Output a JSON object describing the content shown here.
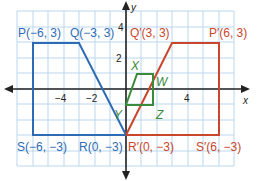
{
  "diagram": {
    "type": "coordinate-plane-transformation",
    "axes": {
      "x_label": "x",
      "y_label": "y",
      "x_ticks": [
        "−4",
        "−2",
        "4"
      ],
      "y_ticks": [
        "4",
        "2"
      ]
    },
    "colors": {
      "original": "#2e6bb5",
      "image": "#c9462c",
      "center": "#3a8a3a",
      "grid": "#b9d7ee",
      "axis": "#222222"
    },
    "original_labels": {
      "P": "P(−6, 3)",
      "Q": "Q(−3, 3)",
      "R": "R(0, −3)",
      "S": "S(−6, −3)"
    },
    "image_labels": {
      "P": "P′(6, 3)",
      "Q": "Q′(3, 3)",
      "R": "R′(0, −3)",
      "S": "S′(6, −3)"
    },
    "center_labels": {
      "X": "X",
      "W": "W",
      "Z": "Z",
      "Y": "Y"
    }
  }
}
